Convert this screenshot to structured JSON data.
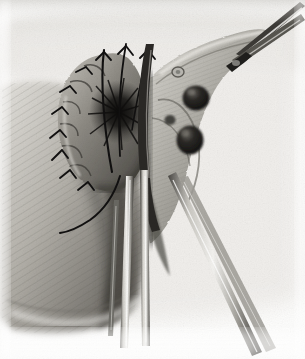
{
  "figure": {
    "domain": "illustration",
    "medium": "halftone engraving reproduction on aged paper",
    "palette": "monochrome grayscale",
    "title_text": "",
    "caption_text": "",
    "plate_number_text": "",
    "visible_text": [],
    "canvas": {
      "width": 305,
      "height": 359
    }
  },
  "colors": {
    "paper": "#fdfdfc",
    "paper_shadow": "#e9e8e4",
    "light_gray": "#d8d7d2",
    "mid_gray": "#9a9892",
    "dark_gray": "#5c5a55",
    "deep_shadow": "#2e2c29",
    "near_black": "#141312",
    "ink": "#0d0c0b",
    "metal_light": "#f2f1ee",
    "metal_mid": "#b6b4ae",
    "metal_dark": "#3a3835",
    "tissue_light": "#cfcdc6",
    "tissue_mid": "#8b8881",
    "nodule": "#1b1a18"
  },
  "regions": [
    {
      "id": "background-field",
      "name": "background-tissue-field",
      "label": "Pale textured operative field / surrounding tissue",
      "tone": "#eceae6"
    },
    {
      "id": "body-mass",
      "name": "shaded-body-mass",
      "label": "Large shaded abdominal wall mass, lower left, hatched mid-gray",
      "tone": "#8b8881"
    },
    {
      "id": "stump",
      "name": "sutured-bowel-stump",
      "label": "Everted bowel stump closed with interrupted sutures",
      "tone": "#6f6d67"
    },
    {
      "id": "suture-burst",
      "name": "suture-convergence-center",
      "label": "Dark radiating center where suture threads converge",
      "tone": "#141312"
    },
    {
      "id": "mesentery",
      "name": "mesenteric-fan",
      "label": "Triangular mesenteric fan extending to upper right",
      "tone": "#b0aea8"
    }
  ],
  "features": [
    {
      "id": "node-upper",
      "name": "lymph-node-upper",
      "label": "Dark rounded lymph node, upper of pair",
      "cx": 196,
      "cy": 98,
      "rx": 13,
      "ry": 12
    },
    {
      "id": "node-lower",
      "name": "lymph-node-lower",
      "label": "Dark rounded lymph node, lower of pair",
      "cx": 190,
      "cy": 140,
      "rx": 13,
      "ry": 14
    },
    {
      "id": "node-small",
      "name": "small-vessel-node",
      "label": "Small pale vessel loop in mesentery",
      "cx": 178,
      "cy": 72,
      "rx": 6,
      "ry": 5
    },
    {
      "id": "node-tiny",
      "name": "small-nodule-left",
      "label": "Small nodule left of node pair",
      "cx": 170,
      "cy": 120,
      "rx": 5,
      "ry": 5
    }
  ],
  "sutures": {
    "name": "interrupted-suture-set",
    "label": "Interrupted black suture knots around everted stump rim",
    "count": 9,
    "trailing_tail_label": "Long curved suture tail trailing to lower left"
  },
  "instruments": [
    {
      "id": "forceps-upper",
      "name": "forceps-upper-right",
      "label": "Long clamp / forceps entering from upper right corner, jaws pointing down-left"
    },
    {
      "id": "shaft-center-a",
      "name": "instrument-shaft-center-left",
      "label": "Slender instrument shaft descending vertically through center"
    },
    {
      "id": "shaft-center-b",
      "name": "instrument-shaft-center-right",
      "label": "Second slender instrument shaft parallel to first"
    },
    {
      "id": "shaft-lower-right",
      "name": "instrument-shaft-lower-right",
      "label": "Instrument shaft angling to lower right corner"
    },
    {
      "id": "blade-curved",
      "name": "curved-blade-instrument",
      "label": "Curved dark blade separating stump from mesentery"
    }
  ]
}
